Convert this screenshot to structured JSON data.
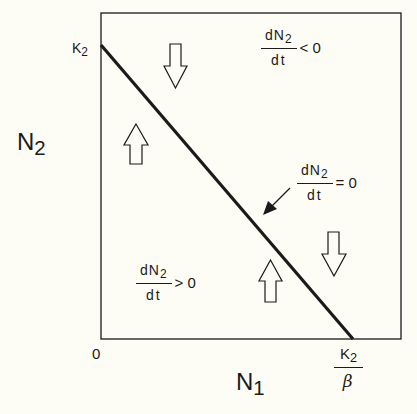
{
  "axes": {
    "y_label": "N",
    "y_label_sub": "2",
    "x_label": "N",
    "x_label_sub": "1",
    "origin_label": "0",
    "y_intercept_label": "K",
    "y_intercept_sub": "2",
    "x_intercept_num": "K",
    "x_intercept_num_sub": "2",
    "x_intercept_den": "β"
  },
  "regions": {
    "above": {
      "num": "dN",
      "num_sub": "2",
      "den": "dt",
      "relation": "< 0",
      "arrow_direction": "down"
    },
    "isocline": {
      "num": "dN",
      "num_sub": "2",
      "den": "dt",
      "relation": "= 0"
    },
    "below": {
      "num": "dN",
      "num_sub": "2",
      "den": "dt",
      "relation": "> 0",
      "arrow_direction": "up"
    }
  },
  "colors": {
    "ink": "#1a1a1a",
    "paper": "#fdfdf5"
  }
}
